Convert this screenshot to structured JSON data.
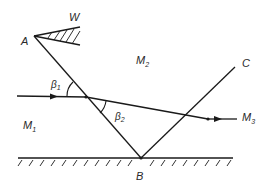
{
  "diagram": {
    "type": "ray-refraction-wedge",
    "points": {
      "A": "A",
      "B": "B",
      "C": "C",
      "W": "W"
    },
    "media": {
      "m1": {
        "base": "M",
        "sub": "1"
      },
      "m2": {
        "base": "M",
        "sub": "2"
      },
      "m3": {
        "base": "M",
        "sub": "3"
      }
    },
    "angles": {
      "beta1": {
        "base": "β",
        "sub": "1"
      },
      "beta2": {
        "base": "β",
        "sub": "2"
      }
    },
    "colors": {
      "line": "#1a1a1a",
      "text": "#2a2a2a",
      "background": "#ffffff"
    }
  }
}
